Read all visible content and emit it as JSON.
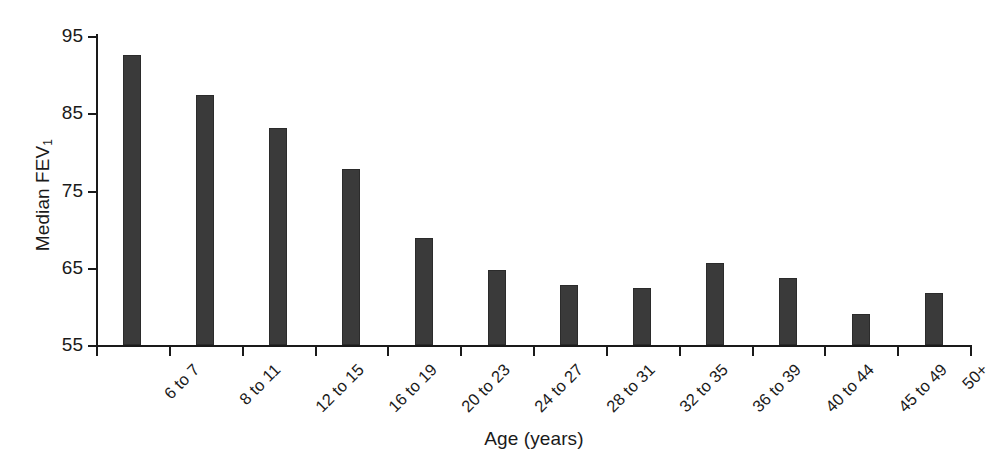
{
  "chart_data": {
    "type": "bar",
    "title": "",
    "xlabel": "Age (years)",
    "ylabel": "Median FEV",
    "ylabel_sub": "1",
    "categories": [
      "6 to 7",
      "8 to 11",
      "12 to 15",
      "16 to 19",
      "20 to 23",
      "24 to 27",
      "28 to 31",
      "32 to 35",
      "36 to 39",
      "40 to 44",
      "45 to 49",
      "50+"
    ],
    "values": [
      92.5,
      87.4,
      83.1,
      77.8,
      68.8,
      64.7,
      62.8,
      62.4,
      65.6,
      63.7,
      59.0,
      61.7
    ],
    "ylim": [
      55,
      95
    ],
    "yticks": [
      55,
      65,
      75,
      85,
      95
    ],
    "ytick_labels": [
      "55",
      "65",
      "75",
      "85",
      "95"
    ],
    "grid": false,
    "legend": false,
    "bar_color": "#3a3a3a",
    "axis_color": "#1a1a1a",
    "background": "#ffffff"
  }
}
